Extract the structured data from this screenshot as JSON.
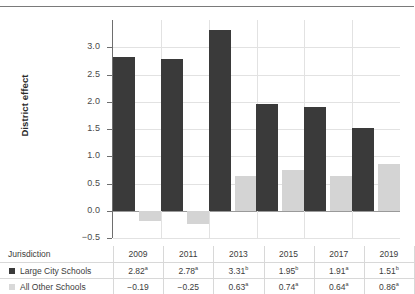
{
  "chart_data": {
    "type": "bar",
    "title": "",
    "xlabel": "",
    "ylabel": "District effect",
    "ylim": [
      -0.5,
      3.5
    ],
    "grid": true,
    "legend_position": "table-below",
    "categories": [
      "2009",
      "2011",
      "2013",
      "2015",
      "2017",
      "2019"
    ],
    "ytick_labels": [
      "3.0",
      "2.5",
      "2.0",
      "1.5",
      "1.0",
      "0.5",
      "0.0",
      "-0.5"
    ],
    "ytick_values": [
      3.0,
      2.5,
      2.0,
      1.5,
      1.0,
      0.5,
      0.0,
      -0.5
    ],
    "series": [
      {
        "name": "Large City Schools",
        "color": "#3a3a3a",
        "values": [
          2.82,
          2.78,
          3.31,
          1.95,
          1.91,
          1.51
        ],
        "labels": [
          "2.82",
          "2.78",
          "3.31",
          "1.95",
          "1.91",
          "1.51"
        ],
        "markers": [
          "a",
          "a",
          "b",
          "b",
          "a",
          "b"
        ]
      },
      {
        "name": "All Other Schools",
        "color": "#d4d4d4",
        "values": [
          -0.19,
          -0.25,
          0.63,
          0.74,
          0.64,
          0.86
        ],
        "labels": [
          "−0.19",
          "−0.25",
          "0.63",
          "0.74",
          "0.64",
          "0.86"
        ],
        "markers": [
          "",
          "",
          "a",
          "a",
          "a",
          "a"
        ]
      }
    ]
  },
  "table": {
    "row_header_label": "Jurisdiction",
    "columns": [
      "2009",
      "2011",
      "2013",
      "2015",
      "2017",
      "2019"
    ],
    "rows": [
      {
        "label": "Large City Schools",
        "swatch": "dark",
        "cells": [
          "2.82",
          "2.78",
          "3.31",
          "1.95",
          "1.91",
          "1.51"
        ],
        "markers": [
          "a",
          "a",
          "b",
          "b",
          "a",
          "b"
        ]
      },
      {
        "label": "All Other Schools",
        "swatch": "light",
        "cells": [
          "−0.19",
          "−0.25",
          "0.63",
          "0.74",
          "0.64",
          "0.86"
        ],
        "markers": [
          "",
          "",
          "a",
          "a",
          "a",
          "a"
        ]
      }
    ]
  },
  "colors": {
    "dark_series": "#3a3a3a",
    "light_series": "#d4d4d4",
    "gridline": "#e2e2e2",
    "axis": "#6e6e6e"
  }
}
